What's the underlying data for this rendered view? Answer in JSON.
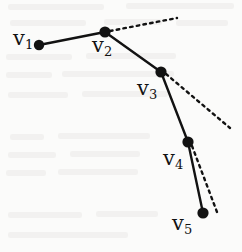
{
  "figure": {
    "type": "polyline-diagram",
    "width": 242,
    "height": 252,
    "background_color": "#fbfbfa",
    "ink_color": "#121212",
    "vertices": [
      {
        "id": "v1",
        "label": "v",
        "subscript": "1",
        "x": 39,
        "y": 45,
        "r": 5.2,
        "label_x": 13,
        "label_y": 28
      },
      {
        "id": "v2",
        "label": "v",
        "subscript": "2",
        "x": 105,
        "y": 32,
        "r": 5.6,
        "label_x": 92,
        "label_y": 35
      },
      {
        "id": "v3",
        "label": "v",
        "subscript": "3",
        "x": 161,
        "y": 72,
        "r": 5.6,
        "label_x": 137,
        "label_y": 78
      },
      {
        "id": "v4",
        "label": "v",
        "subscript": "4",
        "x": 188,
        "y": 142,
        "r": 5.6,
        "label_x": 163,
        "label_y": 148
      },
      {
        "id": "v5",
        "label": "v",
        "subscript": "5",
        "x": 203,
        "y": 213,
        "r": 5.6,
        "label_x": 172,
        "label_y": 213
      }
    ],
    "segments": [
      {
        "id": "seg-v1-v2",
        "from": "v1",
        "to": "v2",
        "x1": 39,
        "y1": 45,
        "x2": 105,
        "y2": 32,
        "style": "solid",
        "width": 2.4
      },
      {
        "id": "seg-v2-v3",
        "from": "v2",
        "to": "v3",
        "x1": 105,
        "y1": 32,
        "x2": 161,
        "y2": 72,
        "style": "solid",
        "width": 2.4
      },
      {
        "id": "seg-v3-v4",
        "from": "v3",
        "to": "v4",
        "x1": 161,
        "y1": 72,
        "x2": 188,
        "y2": 142,
        "style": "solid",
        "width": 2.4
      },
      {
        "id": "seg-v4-v5",
        "from": "v4",
        "to": "v5",
        "x1": 188,
        "y1": 142,
        "x2": 203,
        "y2": 213,
        "style": "solid",
        "width": 2.4
      }
    ],
    "dotted_rays": [
      {
        "id": "ray-v2",
        "from": "v2",
        "x1": 110,
        "y1": 31,
        "x2": 177,
        "y2": 18,
        "style": "dotted",
        "width": 2.4
      },
      {
        "id": "ray-v3",
        "from": "v3",
        "x1": 166,
        "y1": 74,
        "x2": 230,
        "y2": 128,
        "style": "dotted",
        "width": 2.4
      },
      {
        "id": "ray-v4",
        "from": "v4",
        "x1": 192,
        "y1": 146,
        "x2": 217,
        "y2": 212,
        "style": "dotted",
        "width": 2.4
      }
    ]
  }
}
